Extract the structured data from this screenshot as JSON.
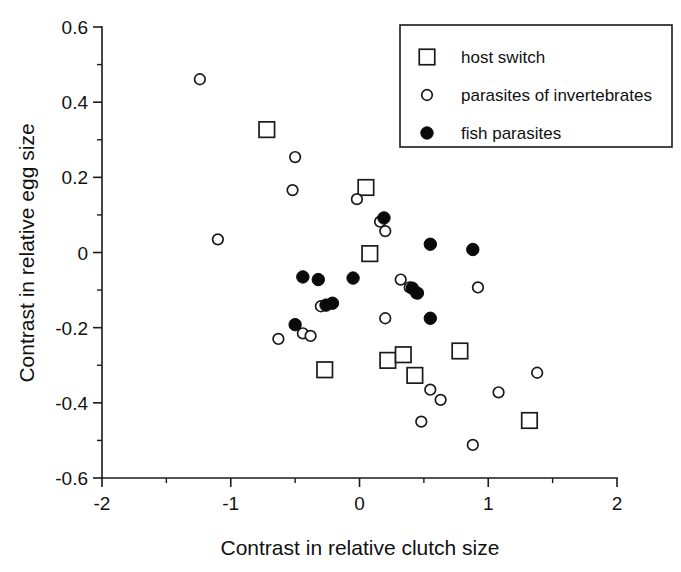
{
  "chart_data": {
    "type": "scatter",
    "title": "",
    "xlabel": "Contrast in relative clutch size",
    "ylabel": "Contrast in relative egg size",
    "xlim": [
      -2,
      2
    ],
    "ylim": [
      -0.6,
      0.6
    ],
    "xticks": [
      -2,
      -1,
      0,
      1,
      2
    ],
    "xtick_labels": [
      "-2",
      "-1",
      "0",
      "1",
      "2"
    ],
    "yticks": [
      0.6,
      0.4,
      0.2,
      0,
      -0.2,
      -0.4,
      -0.6
    ],
    "ytick_labels": [
      "0.6",
      "0.4",
      "0.2",
      "0",
      "-0.2",
      "-0.4",
      "-0.6"
    ],
    "x_minor_ticks": [
      -1.5,
      -0.5,
      0.5,
      1.5
    ],
    "y_minor_ticks": [
      0.5,
      0.3,
      0.1,
      -0.1,
      -0.3,
      -0.5
    ],
    "grid": false,
    "legend_position": "top-right",
    "series": [
      {
        "name": "host switch",
        "marker": "open-square",
        "marker_color": "#1a1a1a",
        "points": [
          [
            -0.72,
            0.327
          ],
          [
            0.05,
            0.173
          ],
          [
            0.08,
            -0.003
          ],
          [
            -0.27,
            -0.312
          ],
          [
            0.22,
            -0.287
          ],
          [
            0.34,
            -0.272
          ],
          [
            0.43,
            -0.327
          ],
          [
            0.78,
            -0.262
          ],
          [
            1.32,
            -0.447
          ]
        ]
      },
      {
        "name": "parasites of invertebrates",
        "marker": "open-circle",
        "marker_color": "#1a1a1a",
        "points": [
          [
            -1.24,
            0.461
          ],
          [
            -0.5,
            0.254
          ],
          [
            -0.52,
            0.166
          ],
          [
            -1.1,
            0.035
          ],
          [
            -0.02,
            0.142
          ],
          [
            0.2,
            0.057
          ],
          [
            0.16,
            0.082
          ],
          [
            0.32,
            -0.072
          ],
          [
            0.39,
            -0.093
          ],
          [
            0.44,
            -0.108
          ],
          [
            0.2,
            -0.175
          ],
          [
            -0.63,
            -0.23
          ],
          [
            -0.44,
            -0.215
          ],
          [
            -0.38,
            -0.222
          ],
          [
            -0.3,
            -0.143
          ],
          [
            0.92,
            -0.093
          ],
          [
            1.38,
            -0.32
          ],
          [
            0.55,
            -0.365
          ],
          [
            0.63,
            -0.392
          ],
          [
            0.48,
            -0.45
          ],
          [
            0.88,
            -0.512
          ],
          [
            1.08,
            -0.372
          ]
        ]
      },
      {
        "name": "fish parasites",
        "marker": "filled-circle",
        "marker_color": "#0a0a0a",
        "points": [
          [
            -0.44,
            -0.065
          ],
          [
            -0.32,
            -0.072
          ],
          [
            -0.26,
            -0.14
          ],
          [
            -0.21,
            -0.135
          ],
          [
            -0.5,
            -0.192
          ],
          [
            -0.05,
            -0.068
          ],
          [
            0.19,
            0.092
          ],
          [
            0.41,
            -0.095
          ],
          [
            0.45,
            -0.108
          ],
          [
            0.55,
            0.022
          ],
          [
            0.88,
            0.008
          ],
          [
            0.55,
            -0.175
          ]
        ]
      }
    ]
  },
  "legend": {
    "entries": [
      {
        "label": "host switch",
        "marker": "open-square"
      },
      {
        "label": "parasites of invertebrates",
        "marker": "open-circle"
      },
      {
        "label": "fish parasites",
        "marker": "filled-circle"
      }
    ]
  }
}
